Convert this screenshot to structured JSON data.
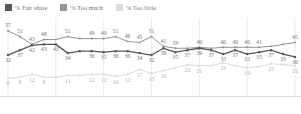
{
  "legend": {
    "items": [
      {
        "label": "% Fair share",
        "color": "#58585a",
        "icon": "legend-swatch-icon"
      },
      {
        "label": "% Too much",
        "color": "#939598",
        "icon": "legend-swatch-icon"
      },
      {
        "label": "% Too little",
        "color": "#d9dadb",
        "icon": "legend-swatch-icon"
      }
    ]
  },
  "chart_data": {
    "type": "line",
    "title": "",
    "subtitle": "",
    "xlabel": "",
    "ylabel": "",
    "ylim": [
      0,
      62
    ],
    "grid": true,
    "legend_position": "top-left",
    "x": [
      0,
      1,
      2,
      3,
      4,
      5,
      6,
      7,
      8,
      9,
      10,
      11,
      12,
      13,
      14,
      15,
      16,
      17,
      18,
      19,
      20,
      21,
      22,
      23,
      24
    ],
    "categories": [
      "",
      "",
      "",
      "",
      "",
      "",
      "",
      "",
      "",
      "",
      "",
      "",
      "",
      "",
      "",
      "",
      "",
      "",
      "",
      "",
      "",
      "",
      "",
      "",
      ""
    ],
    "series": [
      {
        "name": "% Fair share",
        "color": "#58585a",
        "values": [
          32,
          37,
          42,
          43,
          43,
          34,
          36,
          36,
          35,
          36,
          36,
          34,
          32,
          39,
          35,
          37,
          39,
          37,
          33,
          37,
          33,
          35,
          37,
          33,
          30
        ],
        "labels": [
          "32",
          "37",
          "42",
          "43",
          "43",
          "34",
          "",
          "36",
          "35",
          "36",
          "36",
          "34",
          "32",
          "39",
          "35",
          "37",
          "39",
          "37",
          "33",
          "37",
          "33",
          "35",
          "37",
          "33",
          "30"
        ]
      },
      {
        "name": "% Too much",
        "color": "#939598",
        "values": [
          57,
          51,
          43,
          48,
          48,
          51,
          49,
          49,
          49,
          51,
          46,
          45,
          51,
          41,
          39,
          39,
          40,
          39,
          40,
          40,
          40,
          40,
          41,
          43,
          45
        ],
        "labels": [
          "57",
          "51",
          "43",
          "48",
          "",
          "51",
          "",
          "49",
          "49",
          "51",
          "46",
          "45",
          "51",
          "41",
          "39",
          "",
          "40",
          "",
          "40",
          "40",
          "40",
          "41",
          "",
          "",
          "45"
        ]
      },
      {
        "name": "% Too little",
        "color": "#d9dadb",
        "values": [
          8,
          9,
          12,
          9,
          9,
          11,
          11,
          12,
          12,
          10,
          12,
          17,
          13,
          16,
          19,
          22,
          21,
          21,
          24,
          21,
          19,
          20,
          23,
          22,
          21
        ],
        "labels": [
          "8",
          "9",
          "12",
          "9",
          "",
          "11",
          "",
          "12",
          "12",
          "10",
          "12",
          "17",
          "13",
          "16",
          "",
          "22",
          "21",
          "",
          "24",
          "",
          "19",
          "",
          "23",
          "",
          "21"
        ]
      }
    ]
  }
}
